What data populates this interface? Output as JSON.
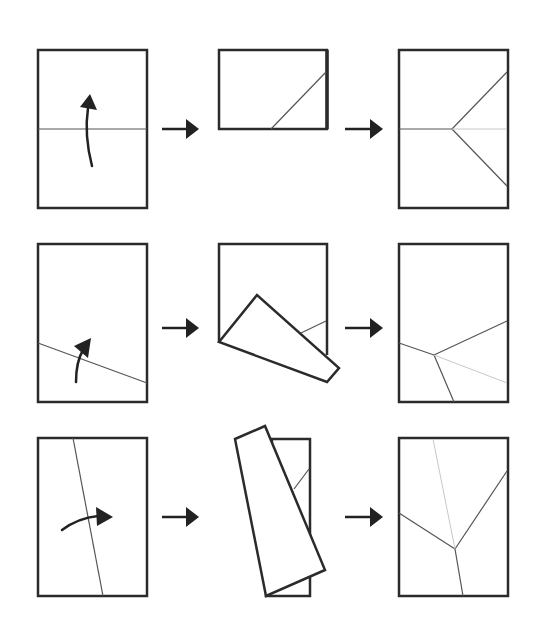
{
  "diagram": {
    "colors": {
      "outline": "#2b2b2b",
      "crease": "#555555",
      "crease_faint": "#c8c8c8",
      "arrow": "#222222",
      "background": "#ffffff"
    },
    "rows": [
      {
        "name": "row-1-horizontal-fold",
        "step_arrows": [
          {
            "x1": 162,
            "y1": 129,
            "x2": 199,
            "y2": 129
          },
          {
            "x1": 345,
            "y1": 129,
            "x2": 383,
            "y2": 129
          }
        ],
        "panels": [
          {
            "name": "sheet-with-center-crease",
            "rects": [
              {
                "x": 38,
                "y": 50,
                "w": 109,
                "h": 158
              }
            ],
            "polygons": [],
            "lines": [
              {
                "x1": 38,
                "y1": 129,
                "x2": 147,
                "y2": 129,
                "style": "crease"
              }
            ],
            "fold_arrow": {
              "path": "M 92 166 Q 84 135 88 108",
              "tip": [
                [
                  80,
                  107
                ],
                [
                  90,
                  94
                ],
                [
                  97,
                  110
                ]
              ]
            }
          },
          {
            "name": "folded-half-sheet",
            "rects": [
              {
                "x": 219,
                "y": 50,
                "w": 108,
                "h": 79
              }
            ],
            "polygons": [],
            "lines": [
              {
                "x1": 327,
                "y1": 50,
                "x2": 327,
                "y2": 129,
                "style": "thick"
              },
              {
                "x1": 271,
                "y1": 129,
                "x2": 326,
                "y2": 72,
                "style": "crease"
              }
            ],
            "fold_arrow": null
          },
          {
            "name": "unfolded-y-crease",
            "rects": [
              {
                "x": 399,
                "y": 50,
                "w": 109,
                "h": 158
              }
            ],
            "polygons": [],
            "lines": [
              {
                "x1": 399,
                "y1": 129,
                "x2": 452,
                "y2": 129,
                "style": "crease"
              },
              {
                "x1": 452,
                "y1": 129,
                "x2": 507,
                "y2": 72,
                "style": "crease"
              },
              {
                "x1": 452,
                "y1": 129,
                "x2": 507,
                "y2": 186,
                "style": "crease"
              },
              {
                "x1": 452,
                "y1": 129,
                "x2": 507,
                "y2": 129,
                "style": "faint"
              }
            ],
            "fold_arrow": null
          }
        ]
      },
      {
        "name": "row-2-slanted-fold",
        "step_arrows": [
          {
            "x1": 162,
            "y1": 328,
            "x2": 199,
            "y2": 328
          },
          {
            "x1": 345,
            "y1": 328,
            "x2": 383,
            "y2": 328
          }
        ],
        "panels": [
          {
            "name": "sheet-with-slanted-crease",
            "rects": [
              {
                "x": 38,
                "y": 244,
                "w": 109,
                "h": 158
              }
            ],
            "polygons": [],
            "lines": [
              {
                "x1": 38,
                "y1": 343,
                "x2": 147,
                "y2": 383,
                "style": "crease"
              }
            ],
            "fold_arrow": {
              "path": "M 76 382 Q 76 362 83 350",
              "tip": [
                [
                  74,
                  346
                ],
                [
                  91,
                  338
                ],
                [
                  88,
                  358
                ]
              ]
            }
          },
          {
            "name": "sheet-with-folded-flap",
            "rects": [],
            "polygons": [
              {
                "points": "219,342 219,244 327,244 327,355",
                "fill": "#ffffff",
                "closed": false
              },
              {
                "points": "219,342 257,295 339,368 327,382",
                "fill": "#ffffff",
                "closed": true
              }
            ],
            "lines": [
              {
                "x1": 301,
                "y1": 333,
                "x2": 326,
                "y2": 321,
                "style": "crease"
              }
            ],
            "fold_arrow": null
          },
          {
            "name": "unfolded-slanted-y-crease",
            "rects": [
              {
                "x": 399,
                "y": 244,
                "w": 109,
                "h": 158
              }
            ],
            "polygons": [],
            "lines": [
              {
                "x1": 399,
                "y1": 343,
                "x2": 434,
                "y2": 355,
                "style": "crease"
              },
              {
                "x1": 434,
                "y1": 355,
                "x2": 507,
                "y2": 321,
                "style": "crease"
              },
              {
                "x1": 434,
                "y1": 355,
                "x2": 454,
                "y2": 402,
                "style": "crease"
              },
              {
                "x1": 434,
                "y1": 355,
                "x2": 507,
                "y2": 383,
                "style": "faint"
              }
            ],
            "fold_arrow": null
          }
        ]
      },
      {
        "name": "row-3-near-vertical-fold",
        "step_arrows": [
          {
            "x1": 162,
            "y1": 517,
            "x2": 199,
            "y2": 517
          },
          {
            "x1": 345,
            "y1": 517,
            "x2": 383,
            "y2": 517
          }
        ],
        "panels": [
          {
            "name": "sheet-with-near-vertical-crease",
            "rects": [
              {
                "x": 38,
                "y": 438,
                "w": 109,
                "h": 158
              }
            ],
            "polygons": [],
            "lines": [
              {
                "x1": 73,
                "y1": 438,
                "x2": 103,
                "y2": 596,
                "style": "crease"
              }
            ],
            "fold_arrow": {
              "path": "M 62 530 Q 78 518 98 516",
              "tip": [
                [
                  96,
                  507
                ],
                [
                  113,
                  517
                ],
                [
                  97,
                  526
                ]
              ]
            }
          },
          {
            "name": "sheet-with-folded-strip",
            "rects": [],
            "polygons": [
              {
                "points": "272,439 310,439 310,596 266,596",
                "fill": "#ffffff",
                "closed": true
              },
              {
                "points": "235,439 265,426 325,570 266,596",
                "fill": "#ffffff",
                "closed": true
              }
            ],
            "lines": [
              {
                "x1": 294,
                "y1": 489,
                "x2": 309,
                "y2": 469,
                "style": "crease"
              }
            ],
            "fold_arrow": null
          },
          {
            "name": "unfolded-vertical-y-crease",
            "rects": [
              {
                "x": 399,
                "y": 438,
                "w": 109,
                "h": 158
              }
            ],
            "polygons": [],
            "lines": [
              {
                "x1": 399,
                "y1": 513,
                "x2": 455,
                "y2": 549,
                "style": "crease"
              },
              {
                "x1": 455,
                "y1": 549,
                "x2": 507,
                "y2": 471,
                "style": "crease"
              },
              {
                "x1": 455,
                "y1": 549,
                "x2": 463,
                "y2": 596,
                "style": "crease"
              },
              {
                "x1": 433,
                "y1": 439,
                "x2": 455,
                "y2": 549,
                "style": "faint"
              }
            ],
            "fold_arrow": null
          }
        ]
      }
    ]
  }
}
